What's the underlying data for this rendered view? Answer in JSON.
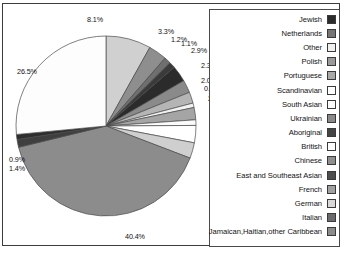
{
  "figure": {
    "title_cropped": "",
    "background": "#ffffff",
    "frame_color": "#3c3c3c"
  },
  "chart_data": {
    "type": "pie",
    "title": "",
    "xlabel": "",
    "ylabel": "",
    "legend_position": "right",
    "grid": false,
    "units": "percent",
    "start_angle_deg": 90,
    "direction": "clockwise",
    "categories": [
      "Jewish",
      "Netherlands",
      "Other",
      "Polish",
      "Portuguese",
      "Scandinavian",
      "South Asian",
      "Ukrainian",
      "Aboriginal",
      "British",
      "Chinese",
      "East and Southeast Asian",
      "French",
      "German",
      "Italian",
      "Jamaican,Haitian,other Caribbean"
    ],
    "values": [
      8.1,
      3.3,
      1.2,
      1.1,
      2.9,
      2.3,
      2.0,
      0.8,
      2.2,
      1.0,
      3.1,
      2.8,
      40.4,
      1.4,
      0.9,
      26.5
    ],
    "labels": [
      "8.1%",
      "3.3%",
      "1.2%",
      "1.1%",
      "2.9%",
      "2.3%",
      "2.0%",
      "0.8%",
      "2.2%",
      "1.0%",
      "3.1%",
      "2.8%",
      "40.4%",
      "1.4%",
      "0.9%",
      "26.5%"
    ],
    "colors": [
      "#d0d0d0",
      "#8e8e8e",
      "#6f6f6f",
      "#3a3a3a",
      "#2b2b2b",
      "#8a8a8a",
      "#b5b5b5",
      "#f2f2f2",
      "#a5a5a5",
      "#fbfbfb",
      "#ffffff",
      "#cfcfcf",
      "#8c8c8c",
      "#3f3f3f",
      "#2e2e2e",
      "#fdfdfd"
    ],
    "slice_order_note": "Slices drawn clockwise from 12 o'clock in legend order; 'Jamaican,Haitian,other Caribbean' 26.5% and 'French' 40.4% are the two largest."
  },
  "pie_labels": [
    {
      "text": "8.1%",
      "x": 84,
      "y": 11
    },
    {
      "text": "3.3%",
      "x": 155,
      "y": 23
    },
    {
      "text": "1.2%",
      "x": 168,
      "y": 31
    },
    {
      "text": "1.1%",
      "x": 178,
      "y": 35
    },
    {
      "text": "2.9%",
      "x": 188,
      "y": 42
    },
    {
      "text": "2.3%",
      "x": 198,
      "y": 57
    },
    {
      "text": "2.0%",
      "x": 198,
      "y": 72
    },
    {
      "text": "0.8%",
      "x": 201,
      "y": 80
    },
    {
      "text": "2.2%",
      "x": 205,
      "y": 90
    },
    {
      "text": "1.0%",
      "x": 206,
      "y": 98
    },
    {
      "text": "3.1%",
      "x": 207,
      "y": 112
    },
    {
      "text": "2.8%",
      "x": 208,
      "y": 130
    },
    {
      "text": "26.5%",
      "x": 14,
      "y": 63
    },
    {
      "text": "0.9%",
      "x": 6,
      "y": 151
    },
    {
      "text": "1.4%",
      "x": 6,
      "y": 160
    },
    {
      "text": "40.4%",
      "x": 122,
      "y": 228
    }
  ],
  "legend": {
    "items": [
      {
        "label": "Jewish",
        "color": "#2b2b2b"
      },
      {
        "label": "Netherlands",
        "color": "#757575"
      },
      {
        "label": "Other",
        "color": "#f0f0f0"
      },
      {
        "label": "Polish",
        "color": "#9a9a9a"
      },
      {
        "label": "Portuguese",
        "color": "#a8a8a8"
      },
      {
        "label": "Scandinavian",
        "color": "#fdfdfd"
      },
      {
        "label": "South Asian",
        "color": "#fafafa"
      },
      {
        "label": "Ukrainian",
        "color": "#898989"
      },
      {
        "label": "Aboriginal",
        "color": "#444444"
      },
      {
        "label": "British",
        "color": "#ffffff"
      },
      {
        "label": "Chinese",
        "color": "#8f8f8f"
      },
      {
        "label": "East and Southeast Asian",
        "color": "#4e4e4e"
      },
      {
        "label": "French",
        "color": "#a0a0a0"
      },
      {
        "label": "German",
        "color": "#d8d8d8"
      },
      {
        "label": "Italian",
        "color": "#6a6a6a"
      },
      {
        "label": "Jamaican,Haitian,other Caribbean",
        "color": "#8b8b8b"
      }
    ]
  }
}
